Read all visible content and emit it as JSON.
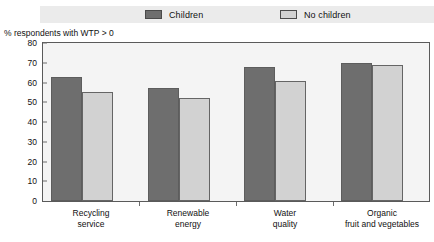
{
  "chart_data": {
    "type": "bar",
    "title": "",
    "xlabel": "",
    "ylabel": "% respondents with WTP > 0",
    "ylim": [
      0,
      80
    ],
    "yticks": [
      0,
      10,
      20,
      30,
      40,
      50,
      60,
      70,
      80
    ],
    "grid": false,
    "legend_position": "top",
    "categories": [
      "Recycling\nservice",
      "Renewable\nenergy",
      "Water\nquality",
      "Organic\nfruit and vegetables"
    ],
    "category_lines": [
      [
        "Recycling",
        "service"
      ],
      [
        "Renewable",
        "energy"
      ],
      [
        "Water",
        "quality"
      ],
      [
        "Organic",
        "fruit and vegetables"
      ]
    ],
    "series": [
      {
        "name": "Children",
        "color": "#6e6e6e",
        "values": [
          63,
          57,
          68,
          70
        ]
      },
      {
        "name": "No children",
        "color": "#d2d2d2",
        "values": [
          55,
          52,
          61,
          69
        ]
      }
    ]
  },
  "legend": {
    "items": [
      {
        "label": "Children",
        "color": "#6e6e6e"
      },
      {
        "label": "No children",
        "color": "#d2d2d2"
      }
    ]
  },
  "axis": {
    "y_title": "% respondents with WTP > 0",
    "ticks": {
      "t0": "80",
      "t1": "70",
      "t2": "60",
      "t3": "50",
      "t4": "40",
      "t5": "30",
      "t6": "20",
      "t7": "10",
      "t8": "0"
    }
  },
  "categories": {
    "c0": {
      "line1": "Recycling",
      "line2": "service"
    },
    "c1": {
      "line1": "Renewable",
      "line2": "energy"
    },
    "c2": {
      "line1": "Water",
      "line2": "quality"
    },
    "c3": {
      "line1": "Organic",
      "line2": "fruit and vegetables"
    }
  }
}
